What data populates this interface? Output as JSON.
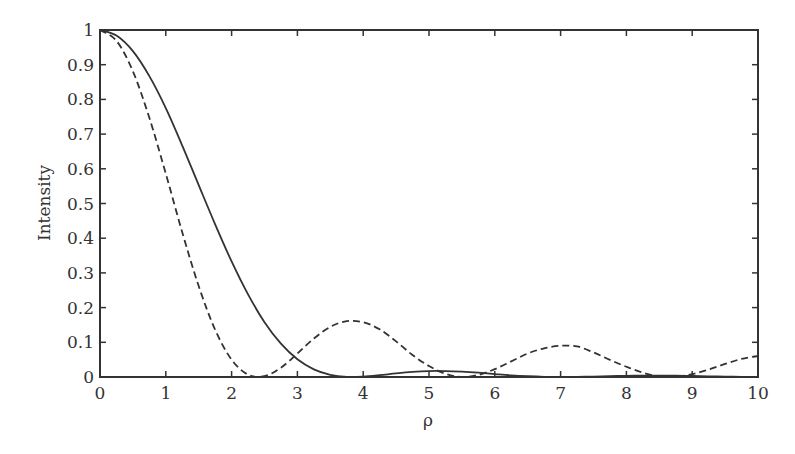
{
  "chart_data": {
    "type": "line",
    "title": "",
    "xlabel": "ρ",
    "ylabel": "Intensity",
    "xlim": [
      0,
      10
    ],
    "ylim": [
      0,
      1
    ],
    "grid": false,
    "legend": null,
    "xticks": [
      "0",
      "1",
      "2",
      "3",
      "4",
      "5",
      "6",
      "7",
      "8",
      "9",
      "10"
    ],
    "yticks": [
      "0",
      "0.1",
      "0.2",
      "0.3",
      "0.4",
      "0.5",
      "0.6",
      "0.7",
      "0.8",
      "0.9",
      "1"
    ],
    "x": [
      0,
      0.25,
      0.5,
      0.75,
      1,
      1.25,
      1.5,
      1.75,
      2,
      2.25,
      2.5,
      2.75,
      3,
      3.25,
      3.5,
      3.75,
      4,
      4.25,
      4.5,
      4.75,
      5,
      5.25,
      5.5,
      5.75,
      6,
      6.25,
      6.5,
      6.75,
      7,
      7.25,
      7.5,
      7.75,
      8,
      8.25,
      8.5,
      8.75,
      9,
      9.25,
      9.5,
      9.75,
      10
    ],
    "series": [
      {
        "name": "solid",
        "style": "solid",
        "color": "#333333",
        "values": [
          1,
          0.984,
          0.939,
          0.867,
          0.775,
          0.667,
          0.553,
          0.44,
          0.333,
          0.238,
          0.158,
          0.096,
          0.051,
          0.022,
          0.0062,
          0.0003,
          0.0011,
          0.0052,
          0.0105,
          0.0148,
          0.0172,
          0.0172,
          0.0154,
          0.0124,
          0.0085,
          0.0048,
          0.0022,
          0.0005,
          0,
          0.0004,
          0.0013,
          0.0024,
          0.0034,
          0.004,
          0.0041,
          0.0037,
          0.003,
          0.002,
          0.0012,
          0.0005,
          0.0001
        ]
      },
      {
        "name": "dashed",
        "style": "dashed",
        "color": "#333333",
        "values": [
          1,
          0.969,
          0.881,
          0.747,
          0.586,
          0.417,
          0.262,
          0.136,
          0.05,
          0.0068,
          0.0023,
          0.0269,
          0.0677,
          0.111,
          0.1445,
          0.1611,
          0.1577,
          0.1375,
          0.1027,
          0.0633,
          0.0315,
          0.0094,
          0.0001,
          0.0059,
          0.0227,
          0.045,
          0.0677,
          0.0828,
          0.0901,
          0.088,
          0.0709,
          0.0494,
          0.0295,
          0.0126,
          0.0018,
          0.0007,
          0.0082,
          0.0213,
          0.0376,
          0.0522,
          0.0605
        ]
      }
    ]
  }
}
